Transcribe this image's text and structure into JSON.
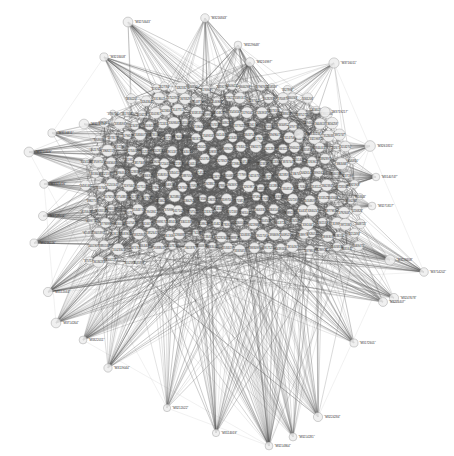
{
  "figure": {
    "kind": "network-graph",
    "title": "",
    "background_color": "#ffffff",
    "width": 454,
    "height": 456
  },
  "style": {
    "node_fill": "#ededed",
    "node_stroke": "#9a9a9a",
    "edge_color": "#5a5a5a",
    "label_color": "#2a2a2a",
    "peripheral_label_color": "#333333"
  },
  "chart_data": {
    "type": "scatter",
    "title": "",
    "xlabel": "",
    "ylabel": "",
    "grid": false,
    "legend": "none",
    "layout": "force-directed",
    "node_count": 302,
    "edge_count": 4180,
    "node_label_format": "quoted numeric identifier",
    "peripheral_nodes": [
      {
        "label": "\"M3274643\"",
        "x": 128,
        "y": 22
      },
      {
        "label": "\"M3216843\"",
        "x": 205,
        "y": 18
      },
      {
        "label": "\"M3229648\"",
        "x": 238,
        "y": 45
      },
      {
        "label": "\"M3216997\"",
        "x": 250,
        "y": 62
      },
      {
        "label": "\"M3218408\"",
        "x": 104,
        "y": 57
      },
      {
        "label": "\"M3716011\"",
        "x": 334,
        "y": 63
      },
      {
        "label": "\"M3719217\"",
        "x": 325,
        "y": 112
      },
      {
        "label": "\"M3140227\"",
        "x": 299,
        "y": 134
      },
      {
        "label": "\"M3261815\"",
        "x": 370,
        "y": 146
      },
      {
        "label": "\"M3271314\"",
        "x": 84,
        "y": 124
      },
      {
        "label": "\"M3114411\"",
        "x": 52,
        "y": 133
      },
      {
        "label": "\"M3210409\"",
        "x": 29,
        "y": 152
      },
      {
        "label": "\"M3140747\"",
        "x": 376,
        "y": 177
      },
      {
        "label": "\"M3271817\"",
        "x": 372,
        "y": 206
      },
      {
        "label": "\"M3321416\"",
        "x": 44,
        "y": 184
      },
      {
        "label": "\"M3719604\"",
        "x": 43,
        "y": 216
      },
      {
        "label": "\"M3216226\"",
        "x": 34,
        "y": 243
      },
      {
        "label": "\"M3119308\"",
        "x": 390,
        "y": 260
      },
      {
        "label": "\"M3714202\"",
        "x": 424,
        "y": 272
      },
      {
        "label": "\"M3247678\"",
        "x": 394,
        "y": 298
      },
      {
        "label": "\"M3224407\"",
        "x": 383,
        "y": 302
      },
      {
        "label": "\"M3112044\"",
        "x": 48,
        "y": 292
      },
      {
        "label": "\"M3714264\"",
        "x": 56,
        "y": 323
      },
      {
        "label": "\"M3172601\"",
        "x": 354,
        "y": 343
      },
      {
        "label": "\"M3322011\"",
        "x": 83,
        "y": 340
      },
      {
        "label": "\"M3119044\"",
        "x": 108,
        "y": 368
      },
      {
        "label": "\"M3212022\"",
        "x": 167,
        "y": 408
      },
      {
        "label": "\"M3224284\"",
        "x": 318,
        "y": 417
      },
      {
        "label": "\"M3114019\"",
        "x": 216,
        "y": 433
      },
      {
        "label": "\"M3214281\"",
        "x": 293,
        "y": 437
      },
      {
        "label": "\"M3214864\"",
        "x": 269,
        "y": 446
      }
    ]
  }
}
